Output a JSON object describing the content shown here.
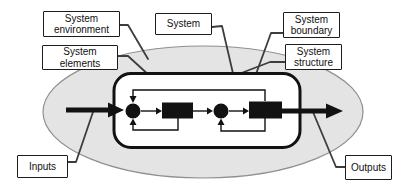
{
  "diagram": {
    "labels": {
      "system_environment": "System\nenvironment",
      "system_elements": "System\nelements",
      "system": "System",
      "system_boundary": "System\nboundary",
      "system_structure": "System\nstructure",
      "inputs": "Inputs",
      "outputs": "Outputs"
    },
    "colors": {
      "environment_fill": "#e4e4e4",
      "environment_stroke": "#8f8f8f",
      "shape_black": "#121212",
      "connector": "#3d3d3d",
      "box_background": "#ffffff"
    }
  }
}
